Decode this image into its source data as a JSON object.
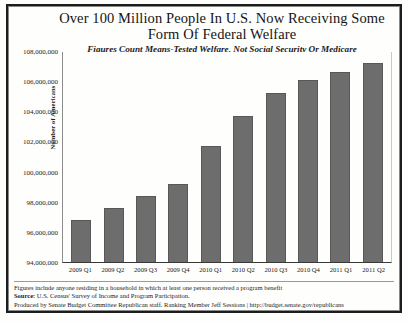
{
  "chart_data": {
    "type": "bar",
    "title": "Over 100 Million People In U.S. Now Receiving Some Form Of Federal Welfare",
    "title_line1": "Over 100 Million People In U.S. Now Receiving Some",
    "title_line2": "Form Of Federal Welfare",
    "subtitle": "Figures Count Means-Tested Welfare, Not Social Security Or Medicare",
    "xlabel": "",
    "ylabel": "Number of Americans",
    "ylim": [
      94000000,
      108000000
    ],
    "ytick_step": 2000000,
    "ytick_labels": [
      "108,000,000",
      "106,000,000",
      "104,000,000",
      "102,000,000",
      "100,000,000",
      "98,000,000",
      "96,000,000",
      "94,000,000"
    ],
    "grid": false,
    "legend": null,
    "categories": [
      "2009 Q1",
      "2009 Q2",
      "2009 Q3",
      "2009 Q4",
      "2010 Q1",
      "2010 Q2",
      "2010 Q3",
      "2010 Q4",
      "2011 Q1",
      "2011 Q2"
    ],
    "values": [
      96800000,
      97600000,
      98400000,
      99200000,
      101700000,
      103700000,
      105200000,
      106100000,
      106600000,
      107200000
    ],
    "bar_color": "#6d6d6d"
  },
  "footnotes": {
    "line1": "Figures include anyone residing in a household in which at least one person received a program benefit",
    "line2_label": "Source:",
    "line2_text": " U.S. Census' Survey of Income and Program Participation.",
    "line3": "Produced by Senate Budget Committee Republican staff. Ranking Member Jeff Sessions | http://budget.senate.gov/republicans"
  }
}
